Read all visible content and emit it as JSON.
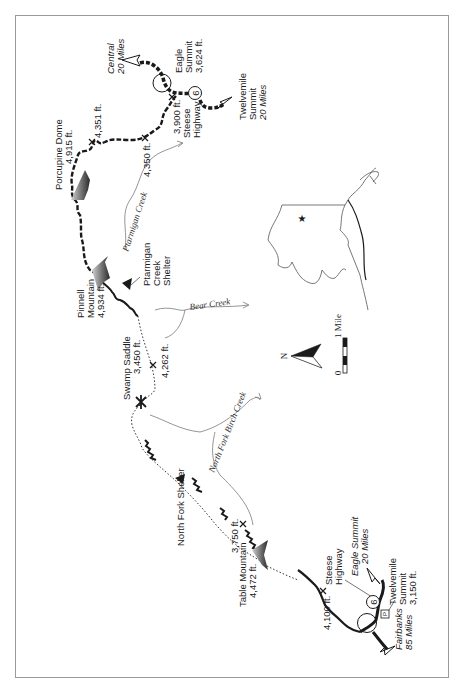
{
  "map": {
    "frame": {
      "x": 15,
      "y": 15,
      "width": 434,
      "height": 663,
      "stroke": "#9a9a9a"
    },
    "colors": {
      "trail": "#1a1a1a",
      "creek": "#7a7a7a",
      "mountain_dark": "#3a3a3a",
      "mountain_light": "#c8c8c8"
    },
    "north_labels": {
      "central": {
        "line1": "Central",
        "line2": "20 Miles"
      },
      "eagle_summit_north": {
        "line1": "Eagle",
        "line2": "Summit",
        "line3": "3,624 ft."
      },
      "twelvemile_north": {
        "line1": "Twelvemile",
        "line2": "Summit",
        "line3": "20 Miles"
      },
      "highway_north": {
        "line1": "Steese",
        "line2": "Highway",
        "route": "6"
      },
      "elev_3900": "3,900 ft.",
      "elev_4351": "4,351 ft.",
      "elev_4350": "4,350 ft.",
      "porcupine_dome": {
        "line1": "Porcupine Dome",
        "line2": "4,915 ft."
      }
    },
    "middle_labels": {
      "ptarmigan_creek": "Ptarmigan Creek",
      "pinnell_mountain": {
        "line1": "Pinnell",
        "line2": "Mountain",
        "line3": "4,934 ft."
      },
      "ptarmigan_shelter": {
        "line1": "Ptarmigan",
        "line2": "Creek",
        "line3": "Shelter"
      },
      "bear_creek": "Bear Creek",
      "swamp_saddle": {
        "line1": "Swamp Saddle",
        "line2": "3,450 ft."
      },
      "elev_4262": "4,262 ft.",
      "north_fork_birch_creek": "North Fork Birch Creek",
      "north_fork_shelter": "North Fork Shelter"
    },
    "south_labels": {
      "elev_3750": "3,750 ft.",
      "table_mountain": {
        "line1": "Table Mountain",
        "line2": "4,472 ft."
      },
      "elev_4100": "4,100 ft.",
      "highway_south": {
        "line1": "Steese",
        "line2": "Highway",
        "route": "6"
      },
      "eagle_summit_south": {
        "line1": "Eagle Summit",
        "line2": "20 Miles"
      },
      "twelvemile_south": {
        "line1": "Twelvemile",
        "line2": "Summit",
        "line3": "3,150 ft."
      },
      "parking": "P",
      "fairbanks": {
        "line1": "Fairbanks",
        "line2": "85 Miles"
      }
    },
    "legend": {
      "north_arrow": "N",
      "scale_start": "0",
      "scale_end": "1 Mile"
    },
    "inset": {
      "marker": "star"
    }
  }
}
